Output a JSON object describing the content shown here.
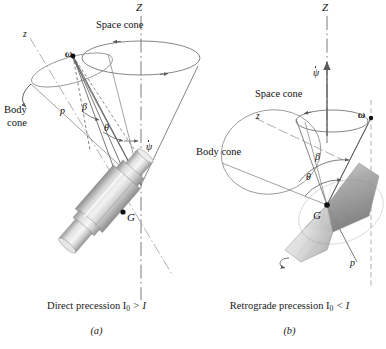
{
  "figure": {
    "panels": [
      {
        "id": "a",
        "caption_main": "Direct precession I",
        "caption_sub": "0",
        "caption_rel": " > I",
        "caption_letter": "(a)",
        "labels": {
          "axis_Z": "Z",
          "axis_z": "z",
          "space_cone": "Space cone",
          "body_cone_line1": "Body",
          "body_cone_line2": "cone",
          "omega": "ω",
          "p": "p",
          "beta": "β",
          "theta": "θ",
          "psi_dot": "ψ",
          "center_of_mass": "G"
        }
      },
      {
        "id": "b",
        "caption_main": "Retrograde precession I",
        "caption_sub": "0",
        "caption_rel": " < I",
        "caption_letter": "(b)",
        "labels": {
          "axis_Z": "Z",
          "axis_z": "z",
          "space_cone": "Space cone",
          "body_cone": "Body cone",
          "omega": "ω",
          "p": "p",
          "beta": "β",
          "theta": "θ",
          "psi_dot": "ψ",
          "center_of_mass": "G"
        }
      }
    ],
    "colors": {
      "line": "#4a4a4a",
      "line_light": "#8a8a8a",
      "body_fill_light": "#e3e3e3",
      "body_fill_mid": "#bdbdbd",
      "body_fill_dark": "#8f8f8f",
      "text": "#111111",
      "background": "#ffffff"
    }
  }
}
